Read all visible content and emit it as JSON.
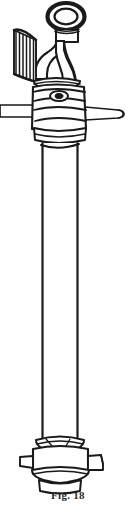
{
  "figure": {
    "caption": "Fig. 18",
    "style": "black-and-white engraving line art",
    "colors": {
      "background": "#ffffff",
      "ink": "#1a1a1a",
      "fill": "#ffffff",
      "caption_text": "#2b2b2b",
      "shade": "#000000"
    },
    "parts": [
      {
        "id": "lifting-eye",
        "label": "Lifting eye ring",
        "shape": "oval ring"
      },
      {
        "id": "eye-stem",
        "label": "Eye stem",
        "shape": "short vertical neck"
      },
      {
        "id": "elbow-bend",
        "label": "Curved elbow",
        "shape": "quarter bend"
      },
      {
        "id": "threaded-outlet",
        "label": "Threaded hose outlet",
        "shape": "ribbed cylinder"
      },
      {
        "id": "upper-collar",
        "label": "Upper collar band",
        "shape": "stacked rings"
      },
      {
        "id": "valve-body",
        "label": "Valve body",
        "shape": "banded barrel"
      },
      {
        "id": "bolt-head",
        "label": "Bolt head",
        "shape": "small oval boss"
      },
      {
        "id": "operating-rod-left",
        "label": "Operating rod, left arm",
        "shape": "horizontal bar"
      },
      {
        "id": "operating-rod-right",
        "label": "Operating rod, right arm",
        "shape": "tapered bar with cap"
      },
      {
        "id": "lower-collar",
        "label": "Lower collar band",
        "shape": "ring"
      },
      {
        "id": "standpipe-shaft",
        "label": "Standpipe shaft",
        "shape": "long vertical pipe"
      },
      {
        "id": "base-ring",
        "label": "Base ring",
        "shape": "flared ring"
      },
      {
        "id": "base-collar",
        "label": "Base collar",
        "shape": "cylinder with lugs"
      },
      {
        "id": "base-lug-left",
        "label": "Left lug",
        "shape": "rectangular ear"
      },
      {
        "id": "base-lug-right",
        "label": "Right lug",
        "shape": "rectangular ear"
      },
      {
        "id": "base-flange",
        "label": "Base flange",
        "shape": "flared foot"
      }
    ]
  }
}
